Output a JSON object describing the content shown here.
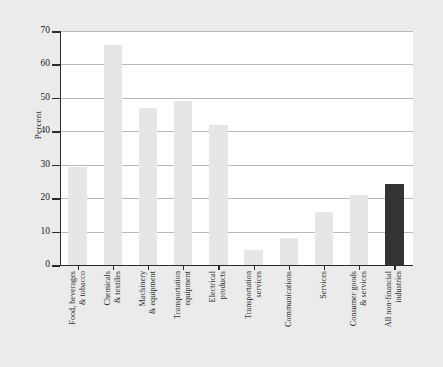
{
  "chart_data": {
    "type": "bar",
    "title": "",
    "xlabel": "",
    "ylabel": "Percent",
    "ylim": [
      0,
      70
    ],
    "yticks": [
      0,
      10,
      20,
      30,
      40,
      50,
      60,
      70
    ],
    "ytick_labels": [
      "0",
      "10",
      "20",
      "30",
      "40",
      "50",
      "60",
      "70"
    ],
    "grid": true,
    "legend": "none",
    "categories": [
      "Food, beverages & tobacco",
      "Chemicals & textiles",
      "Machinery & equipment",
      "Transportation equipment",
      "Electrical products",
      "Transportation services",
      "Communications",
      "Services",
      "Consumer goods & services",
      "All non-financial industries"
    ],
    "category_lines": [
      [
        "Food, beverages",
        "& tobacco"
      ],
      [
        "Chemicals",
        "& textiles"
      ],
      [
        "Machinery",
        "& equipment"
      ],
      [
        "Transportation",
        "equipment"
      ],
      [
        "Electrical",
        "products"
      ],
      [
        "Transportation",
        "services"
      ],
      [
        "Communications",
        ""
      ],
      [
        "Services",
        ""
      ],
      [
        "Consumer goods",
        "& services"
      ],
      [
        "All non-financial",
        "industries"
      ]
    ],
    "values": [
      29.3,
      65.7,
      47.0,
      49.0,
      42.0,
      4.5,
      8.0,
      16.0,
      21.0,
      24.2
    ],
    "bar_styles": [
      "light",
      "light",
      "light",
      "light",
      "light",
      "light",
      "light",
      "light",
      "light",
      "dark"
    ],
    "colors": {
      "bar_light": "#e6e6e6",
      "bar_dark": "#333333",
      "background": "#ebebeb",
      "plot_background": "#ffffff",
      "axis": "#2b2b2b",
      "grid": "#b9b9b9"
    }
  }
}
